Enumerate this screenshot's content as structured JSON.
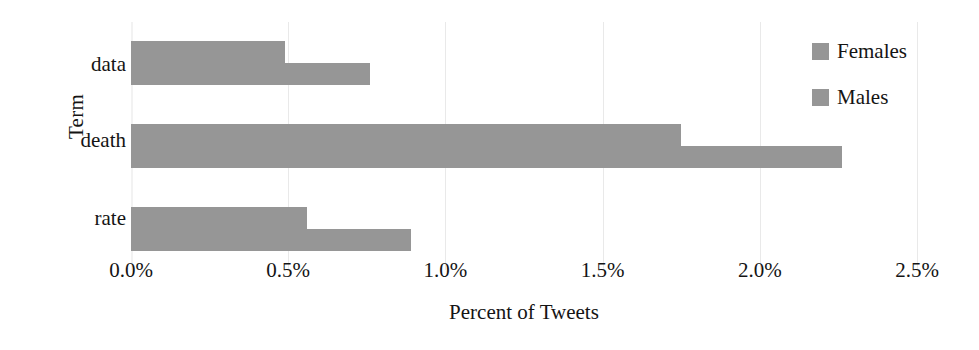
{
  "chart_data": {
    "type": "bar",
    "orientation": "horizontal",
    "title": "",
    "subtitle": "",
    "xlabel": "Percent of Tweets",
    "ylabel": "Term",
    "categories": [
      "data",
      "death",
      "rate"
    ],
    "series": [
      {
        "name": "Females",
        "values": [
          0.49,
          1.75,
          0.56
        ],
        "color": "#969696"
      },
      {
        "name": "Males",
        "values": [
          0.76,
          2.26,
          0.89
        ],
        "color": "#969696"
      }
    ],
    "xlim": [
      0.0,
      2.5
    ],
    "xticks": [
      0.0,
      0.5,
      1.0,
      1.5,
      2.0,
      2.5
    ],
    "xtick_labels": [
      "0.0%",
      "0.5%",
      "1.0%",
      "1.5%",
      "2.0%",
      "2.5%"
    ],
    "grid": true,
    "grid_axis": "x",
    "legend_position": "right",
    "value_suffix": "%"
  },
  "legend": {
    "items": [
      {
        "label": "Females",
        "swatch": "legend-swatch-females"
      },
      {
        "label": "Males",
        "swatch": "legend-swatch-males"
      }
    ]
  },
  "colors": {
    "bar_gray": "#969696",
    "gridline": "#e9e9e9",
    "text": "#141414",
    "background": "#ffffff"
  }
}
